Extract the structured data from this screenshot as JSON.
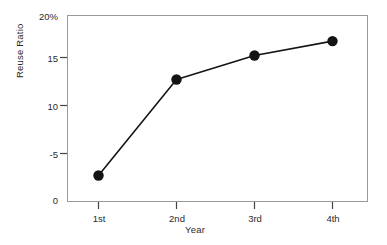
{
  "chart_data": {
    "type": "line",
    "title": "",
    "subtitle": "",
    "xlabel": "Year",
    "ylabel": "Reuse Ratio",
    "categories": [
      "1st",
      "2nd",
      "3rd",
      "4th"
    ],
    "values": [
      2.5,
      12.5,
      15.0,
      16.5
    ],
    "series": [
      {
        "name": "Reuse Ratio",
        "values": [
          2.5,
          12.5,
          15.0,
          16.5
        ]
      }
    ],
    "ylim": [
      0,
      20
    ],
    "ytick_labels": [
      "20%",
      "15",
      "10",
      "-5",
      "0"
    ],
    "ytick_values": [
      20,
      15,
      10,
      5,
      0
    ],
    "xtick_labels": [
      "1st",
      "2nd",
      "3rd",
      "4th"
    ],
    "grid": false,
    "legend": "none",
    "marker": "filled-circle",
    "line_color": "#141414",
    "marker_color": "#141414",
    "axis_color": "#8c8c8c",
    "background": "#ffffff"
  },
  "axes": {
    "y_title": "Reuse Ratio",
    "x_title": "Year"
  },
  "ticks": {
    "y": [
      {
        "label": "20%"
      },
      {
        "label": "15"
      },
      {
        "label": "10"
      },
      {
        "label": "-5"
      },
      {
        "label": "0"
      }
    ],
    "x": [
      {
        "label": "1st"
      },
      {
        "label": "2nd"
      },
      {
        "label": "3rd"
      },
      {
        "label": "4th"
      }
    ]
  }
}
